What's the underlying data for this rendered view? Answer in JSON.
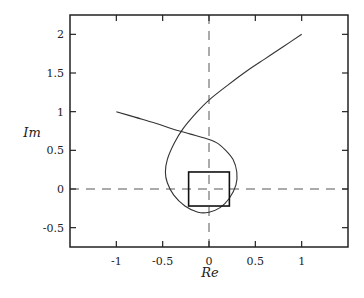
{
  "chart_data": {
    "type": "line",
    "title": "",
    "xlabel": "Re",
    "ylabel": "Im",
    "xlim": [
      -1.5,
      1.5
    ],
    "ylim": [
      -0.75,
      2.25
    ],
    "grid": false,
    "legend": null,
    "x_ticks": [
      -1,
      -0.5,
      0,
      0.5,
      1
    ],
    "x_tick_labels": [
      "-1",
      "-0.5",
      "0",
      "0.5",
      "1"
    ],
    "y_ticks": [
      -0.5,
      0,
      0.5,
      1,
      1.5,
      2
    ],
    "y_tick_labels": [
      "-0.5",
      "0",
      "0.5",
      "1",
      "1.5",
      "2"
    ],
    "reference_lines": [
      {
        "orientation": "horizontal",
        "value": 0,
        "style": "dashed"
      },
      {
        "orientation": "vertical",
        "value": 0,
        "style": "dashed"
      }
    ],
    "series": [
      {
        "name": "curve",
        "style": "solid",
        "points": [
          [
            -1.0,
            1.0
          ],
          [
            -0.8,
            0.93
          ],
          [
            -0.6,
            0.86
          ],
          [
            -0.4,
            0.78
          ],
          [
            -0.2,
            0.71
          ],
          [
            -0.05,
            0.66
          ],
          [
            0.08,
            0.6
          ],
          [
            0.18,
            0.5
          ],
          [
            0.26,
            0.38
          ],
          [
            0.3,
            0.22
          ],
          [
            0.29,
            0.05
          ],
          [
            0.22,
            -0.12
          ],
          [
            0.12,
            -0.24
          ],
          [
            0.0,
            -0.3
          ],
          [
            -0.12,
            -0.3
          ],
          [
            -0.26,
            -0.22
          ],
          [
            -0.38,
            -0.08
          ],
          [
            -0.45,
            0.08
          ],
          [
            -0.47,
            0.22
          ],
          [
            -0.45,
            0.38
          ],
          [
            -0.38,
            0.58
          ],
          [
            -0.28,
            0.78
          ],
          [
            -0.14,
            0.98
          ],
          [
            0.0,
            1.15
          ],
          [
            0.2,
            1.34
          ],
          [
            0.4,
            1.52
          ],
          [
            0.6,
            1.68
          ],
          [
            0.8,
            1.84
          ],
          [
            1.0,
            2.0
          ]
        ]
      }
    ],
    "annotations": [
      {
        "type": "square",
        "x_range": [
          -0.22,
          0.22
        ],
        "y_range": [
          -0.22,
          0.22
        ],
        "style": "solid-thick"
      }
    ]
  }
}
